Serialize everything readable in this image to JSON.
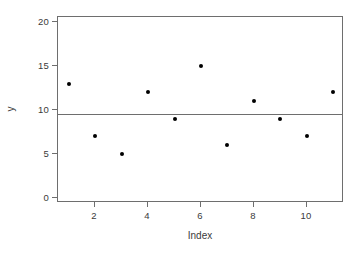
{
  "chart_data": {
    "type": "scatter",
    "title": "",
    "xlabel": "Index",
    "ylabel": "y",
    "x": [
      1,
      2,
      3,
      4,
      5,
      6,
      7,
      8,
      9,
      10,
      11
    ],
    "values": [
      13,
      7,
      5,
      12,
      9,
      15,
      6,
      11,
      9,
      7,
      12
    ],
    "series": [
      {
        "name": "y",
        "marker": "filled-circle",
        "color": "#000000",
        "values": [
          13,
          7,
          5,
          12,
          9,
          15,
          6,
          11,
          9,
          7,
          12
        ]
      }
    ],
    "xlim": [
      0.6,
      11.4
    ],
    "ylim": [
      -0.6,
      20.6
    ],
    "xticks": [
      2,
      4,
      6,
      8,
      10
    ],
    "xtick_labels": [
      "2",
      "4",
      "6",
      "8",
      "10"
    ],
    "yticks": [
      0,
      5,
      10,
      15,
      20
    ],
    "ytick_labels": [
      "0",
      "5",
      "10",
      "15",
      "20"
    ],
    "grid": false,
    "legend": null,
    "annotations": [
      {
        "type": "hline",
        "name": "mean-reference-line",
        "y": 9.6,
        "color": "#6e6e6e"
      }
    ],
    "frame_color": "#6e6e6e",
    "background": "#ffffff"
  }
}
